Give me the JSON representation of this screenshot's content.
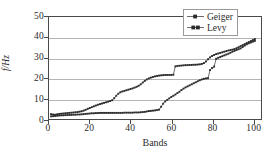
{
  "chart_data": {
    "type": "line",
    "title": "",
    "xlabel": "Bands",
    "ylabel": "f/Hz",
    "xlim": [
      0,
      104
    ],
    "ylim": [
      0,
      50
    ],
    "xticks": [
      0,
      20,
      40,
      60,
      80,
      100
    ],
    "yticks": [
      0,
      10,
      20,
      30,
      40,
      50
    ],
    "grid": "horizontal",
    "legend_position": "top-right",
    "series": [
      {
        "name": "Geiger",
        "marker": "filled-square-small",
        "color": "#2b2b2b",
        "x": [
          1,
          2,
          3,
          4,
          5,
          6,
          7,
          8,
          9,
          10,
          11,
          12,
          13,
          14,
          15,
          16,
          17,
          18,
          19,
          20,
          21,
          22,
          23,
          24,
          25,
          26,
          27,
          28,
          29,
          30,
          31,
          32,
          33,
          34,
          35,
          36,
          37,
          38,
          39,
          40,
          41,
          42,
          43,
          44,
          45,
          46,
          47,
          48,
          49,
          50,
          51,
          52,
          53,
          54,
          55,
          56,
          57,
          58,
          59,
          60,
          61,
          62,
          63,
          64,
          65,
          66,
          67,
          68,
          69,
          70,
          71,
          72,
          73,
          74,
          75,
          76,
          77,
          78,
          79,
          80,
          81,
          82,
          83,
          84,
          85,
          86,
          87,
          88,
          89,
          90,
          91,
          92,
          93,
          94,
          95,
          96,
          97,
          98,
          99,
          100,
          101
        ],
        "y": [
          2.4,
          2.2,
          2.1,
          2.3,
          2.5,
          2.6,
          2.7,
          2.8,
          2.9,
          3.0,
          3.1,
          3.2,
          3.3,
          3.4,
          3.6,
          3.8,
          4.1,
          4.5,
          5.0,
          5.4,
          5.8,
          6.2,
          6.6,
          7.0,
          7.3,
          7.6,
          7.9,
          8.2,
          8.5,
          8.8,
          9.2,
          10.2,
          11.4,
          12.4,
          13.1,
          13.5,
          13.8,
          14.1,
          14.4,
          14.7,
          15.0,
          15.4,
          15.8,
          16.3,
          17.0,
          17.9,
          18.7,
          19.4,
          19.9,
          20.3,
          20.6,
          20.9,
          21.1,
          21.3,
          21.4,
          21.5,
          21.6,
          21.6,
          21.6,
          21.6,
          21.7,
          25.8,
          26.0,
          26.1,
          26.2,
          26.3,
          26.4,
          26.4,
          26.5,
          26.5,
          26.6,
          26.6,
          26.7,
          26.8,
          27.0,
          27.4,
          28.2,
          29.3,
          30.2,
          30.9,
          31.4,
          31.8,
          32.1,
          32.4,
          32.7,
          33.0,
          33.3,
          33.6,
          33.8,
          34.0,
          34.3,
          34.7,
          35.2,
          35.7,
          36.2,
          36.7,
          37.2,
          37.7,
          38.2,
          38.7,
          39.2
        ]
      },
      {
        "name": "Levy",
        "marker": "filled-square-small",
        "color": "#2b2b2b",
        "x": [
          1,
          2,
          3,
          4,
          5,
          6,
          7,
          8,
          9,
          10,
          11,
          12,
          13,
          14,
          15,
          16,
          17,
          18,
          19,
          20,
          21,
          22,
          23,
          24,
          25,
          26,
          27,
          28,
          29,
          30,
          31,
          32,
          33,
          34,
          35,
          36,
          37,
          38,
          39,
          40,
          41,
          42,
          43,
          44,
          45,
          46,
          47,
          48,
          49,
          50,
          51,
          52,
          53,
          54,
          55,
          56,
          57,
          58,
          59,
          60,
          61,
          62,
          63,
          64,
          65,
          66,
          67,
          68,
          69,
          70,
          71,
          72,
          73,
          74,
          75,
          76,
          77,
          78,
          79,
          80,
          81,
          82,
          83,
          84,
          85,
          86,
          87,
          88,
          89,
          90,
          91,
          92,
          93,
          94,
          95,
          96,
          97,
          98,
          99,
          100,
          101
        ],
        "y": [
          1.3,
          1.4,
          1.5,
          1.6,
          1.7,
          1.8,
          1.8,
          1.9,
          1.9,
          2.0,
          2.0,
          2.1,
          2.1,
          2.2,
          2.2,
          2.3,
          2.4,
          2.5,
          2.6,
          2.7,
          2.8,
          2.8,
          2.9,
          2.9,
          3.0,
          3.0,
          3.0,
          3.0,
          3.0,
          3.0,
          3.0,
          3.0,
          3.0,
          3.0,
          3.0,
          3.0,
          3.1,
          3.1,
          3.1,
          3.1,
          3.1,
          3.2,
          3.2,
          3.2,
          3.3,
          3.4,
          3.5,
          3.7,
          3.9,
          4.0,
          4.1,
          4.2,
          4.4,
          4.6,
          6.0,
          7.5,
          8.6,
          9.4,
          10.1,
          10.8,
          11.4,
          12.0,
          12.7,
          13.4,
          14.2,
          14.9,
          15.5,
          16.0,
          16.5,
          17.0,
          17.5,
          18.0,
          18.5,
          19.0,
          19.4,
          19.7,
          19.9,
          20.0,
          24.0,
          25.0,
          25.7,
          29.5,
          30.0,
          30.4,
          30.8,
          31.2,
          31.6,
          32.0,
          32.5,
          33.0,
          33.4,
          33.8,
          34.2,
          34.6,
          35.3,
          36.0,
          36.6,
          37.1,
          37.5,
          37.9,
          38.3
        ]
      }
    ]
  },
  "axes": {
    "xticks_labels": [
      "0",
      "20",
      "40",
      "60",
      "80",
      "100"
    ],
    "yticks_labels": [
      "0",
      "10",
      "20",
      "30",
      "40",
      "50"
    ],
    "xlabel": "Bands",
    "ylabel": "f/Hz"
  },
  "legend": {
    "items": [
      {
        "label": "Geiger"
      },
      {
        "label": "Levy"
      }
    ]
  }
}
